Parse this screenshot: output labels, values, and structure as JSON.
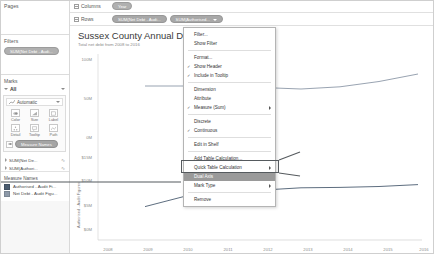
{
  "sidebar": {
    "pages": {
      "title": "Pages"
    },
    "filters": {
      "title": "Filters",
      "pills": [
        {
          "label": "SUM(Net Debt - Audi..."
        }
      ]
    },
    "marks": {
      "title": "Marks",
      "all_label": "All",
      "mark_type": "Automatic",
      "shelf_buttons": [
        {
          "label": "Color",
          "icon": "color-icon"
        },
        {
          "label": "Size",
          "icon": "size-icon"
        },
        {
          "label": "Label",
          "icon": "label-icon"
        },
        {
          "label": "Detail",
          "icon": "detail-icon"
        },
        {
          "label": "Tooltip",
          "icon": "tooltip-icon"
        },
        {
          "label": "Path",
          "icon": "path-icon"
        }
      ],
      "color_pill": "Measure Names",
      "measure_cards": [
        {
          "label": "SUM(Net De..."
        },
        {
          "label": "SUM(Authori..."
        }
      ]
    },
    "legend": {
      "title": "Measure Names",
      "items": [
        {
          "label": "Authorised - Audit Fi...",
          "color": "#4b5c70"
        },
        {
          "label": "Net Debt - Audit Figu...",
          "color": "#8d99a8"
        }
      ]
    }
  },
  "shelves": {
    "columns": {
      "name": "Columns",
      "pills": [
        {
          "label": "Year"
        }
      ]
    },
    "rows": {
      "name": "Rows",
      "pills": [
        {
          "label": "SUM(Net Debt - Audi..."
        },
        {
          "label": "SUM(Authorised..."
        }
      ]
    }
  },
  "viz": {
    "title": "Sussex County Annual Debt",
    "subtitle": "Total net debt from 2008 to 2016",
    "y_axis_title": "Authorised - Audit Figures",
    "upper_ticks": [
      "100M",
      "50M",
      "0M"
    ],
    "lower_ticks": [
      "$15M",
      "$10M",
      "$5M",
      "$0M"
    ],
    "x_ticks": [
      "2008",
      "2009",
      "2010",
      "2011",
      "2012",
      "2013",
      "2014",
      "2015",
      "2016"
    ]
  },
  "chart_data": {
    "type": "line",
    "title": "Sussex County Annual Debt",
    "subtitle": "Total net debt from 2008 to 2016",
    "xlabel": "Year",
    "ylabel": "Authorised - Audit Figures",
    "grid": false,
    "legend_position": "left-sidebar",
    "x": [
      2008,
      2009,
      2010,
      2011,
      2012,
      2013,
      2014,
      2015,
      2016
    ],
    "panels": [
      {
        "name": "Net Debt - Audit Figures",
        "ylim": [
          0,
          112
        ],
        "yticks": [
          0,
          50,
          100
        ],
        "ytick_labels": [
          "0M",
          "50M",
          "100M"
        ],
        "color": "#8d99a8",
        "values": [
          null,
          72,
          72,
          71,
          70,
          68,
          71,
          78,
          88
        ]
      },
      {
        "name": "Authorised - Audit Figures",
        "ylim": [
          0,
          17.5
        ],
        "yticks": [
          0,
          5,
          10,
          15
        ],
        "ytick_labels": [
          "$0M",
          "$5M",
          "$10M",
          "$15M"
        ],
        "color": "#4b5c70",
        "values": [
          null,
          6.0,
          8.2,
          10.2,
          9.6,
          10.1,
          10.2,
          10.4,
          10.8
        ]
      }
    ]
  },
  "context_menu": {
    "items": [
      {
        "label": "Filter...",
        "checked": false,
        "submenu": false,
        "sep_after": false
      },
      {
        "label": "Show Filter",
        "checked": false,
        "submenu": false,
        "sep_after": true
      },
      {
        "label": "Format...",
        "checked": false,
        "submenu": false,
        "sep_after": false
      },
      {
        "label": "Show Header",
        "checked": true,
        "submenu": false,
        "sep_after": false
      },
      {
        "label": "Include in Tooltip",
        "checked": true,
        "submenu": false,
        "sep_after": true
      },
      {
        "label": "Dimension",
        "checked": false,
        "submenu": false,
        "sep_after": false
      },
      {
        "label": "Attribute",
        "checked": false,
        "submenu": false,
        "sep_after": false
      },
      {
        "label": "Measure (Sum)",
        "checked": true,
        "submenu": true,
        "sep_after": true
      },
      {
        "label": "Discrete",
        "checked": false,
        "submenu": false,
        "sep_after": false
      },
      {
        "label": "Continuous",
        "checked": true,
        "submenu": false,
        "sep_after": true
      },
      {
        "label": "Edit in Shelf",
        "checked": false,
        "submenu": false,
        "sep_after": true
      },
      {
        "label": "Add Table Calculation...",
        "checked": false,
        "submenu": false,
        "sep_after": false
      },
      {
        "label": "Quick Table Calculation",
        "checked": false,
        "submenu": true,
        "sep_after": false
      },
      {
        "label": "Dual Axis",
        "checked": false,
        "submenu": false,
        "sep_after": false,
        "highlight": true
      },
      {
        "label": "Mark Type",
        "checked": false,
        "submenu": true,
        "sep_after": true
      },
      {
        "label": "Remove",
        "checked": false,
        "submenu": false,
        "sep_after": false
      }
    ]
  },
  "annotation": {
    "color": "#555a5e",
    "target_label": "Dual Axis"
  }
}
